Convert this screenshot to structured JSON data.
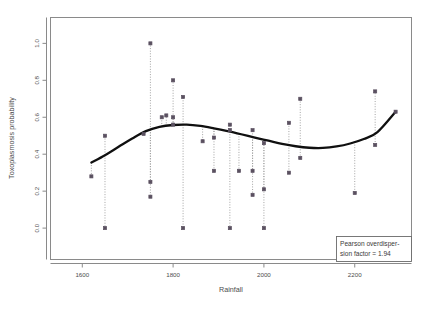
{
  "chart_data": {
    "type": "scatter",
    "title": "",
    "xlabel": "Rainfall",
    "ylabel": "Toxoplasmosis probability",
    "xlim": [
      1530,
      2325
    ],
    "ylim": [
      -0.17,
      1.14
    ],
    "xticks": [
      1600,
      1800,
      2000,
      2200
    ],
    "xticklabels": [
      "1600",
      "1800",
      "2000",
      "2200"
    ],
    "yticks": [
      0.0,
      0.2,
      0.4,
      0.6,
      0.8,
      1.0
    ],
    "yticklabels": [
      "0.0",
      "0.2",
      "0.4",
      "0.6",
      "0.8",
      "1.0"
    ],
    "grid": false,
    "legend": "none",
    "point_color": "#5a5060",
    "line_color": "#101010",
    "dropline_color": "#9a9a9a",
    "frame_color": "#888888",
    "series": [
      {
        "name": "Observed toxoplasmosis probability",
        "marker": "square",
        "droplines_to": "fitted curve",
        "points": [
          {
            "x": 1620,
            "y": 0.28
          },
          {
            "x": 1650,
            "y": 0.5
          },
          {
            "x": 1650,
            "y": 0.0
          },
          {
            "x": 1735,
            "y": 0.51
          },
          {
            "x": 1750,
            "y": 1.0
          },
          {
            "x": 1750,
            "y": 0.25
          },
          {
            "x": 1750,
            "y": 0.17
          },
          {
            "x": 1775,
            "y": 0.6
          },
          {
            "x": 1785,
            "y": 0.61
          },
          {
            "x": 1800,
            "y": 0.6
          },
          {
            "x": 1800,
            "y": 0.8
          },
          {
            "x": 1800,
            "y": 0.56
          },
          {
            "x": 1822,
            "y": 0.71
          },
          {
            "x": 1822,
            "y": 0.0
          },
          {
            "x": 1865,
            "y": 0.47
          },
          {
            "x": 1890,
            "y": 0.49
          },
          {
            "x": 1890,
            "y": 0.31
          },
          {
            "x": 1925,
            "y": 0.56
          },
          {
            "x": 1925,
            "y": 0.53
          },
          {
            "x": 1925,
            "y": 0.0
          },
          {
            "x": 1945,
            "y": 0.31
          },
          {
            "x": 1975,
            "y": 0.53
          },
          {
            "x": 1975,
            "y": 0.31
          },
          {
            "x": 1975,
            "y": 0.18
          },
          {
            "x": 2000,
            "y": 0.46
          },
          {
            "x": 2000,
            "y": 0.21
          },
          {
            "x": 2000,
            "y": 0.0
          },
          {
            "x": 2055,
            "y": 0.57
          },
          {
            "x": 2055,
            "y": 0.3
          },
          {
            "x": 2080,
            "y": 0.7
          },
          {
            "x": 2080,
            "y": 0.38
          },
          {
            "x": 2200,
            "y": 0.19
          },
          {
            "x": 2245,
            "y": 0.74
          },
          {
            "x": 2245,
            "y": 0.45
          },
          {
            "x": 2290,
            "y": 0.63
          }
        ]
      }
    ],
    "fitted_curve": {
      "name": "Smoothed fit",
      "x": [
        1620,
        1650,
        1680,
        1710,
        1740,
        1770,
        1800,
        1830,
        1860,
        1890,
        1920,
        1950,
        1980,
        2010,
        2040,
        2070,
        2100,
        2130,
        2160,
        2190,
        2220,
        2250,
        2290
      ],
      "y": [
        0.355,
        0.395,
        0.44,
        0.485,
        0.525,
        0.548,
        0.558,
        0.56,
        0.553,
        0.54,
        0.525,
        0.508,
        0.49,
        0.473,
        0.456,
        0.443,
        0.435,
        0.434,
        0.442,
        0.458,
        0.482,
        0.52,
        0.63
      ]
    },
    "annotation": {
      "line1": "Pearson overdisper-",
      "line2": "sion factor = 1.94"
    }
  }
}
